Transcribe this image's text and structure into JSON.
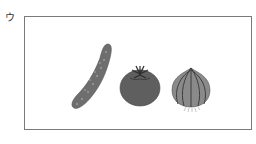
{
  "figure": {
    "label": "ウ",
    "items": [
      {
        "name": "cucumber",
        "description": "long curved dotted vegetable"
      },
      {
        "name": "tomato",
        "description": "round vegetable with leafy stem"
      },
      {
        "name": "onion",
        "description": "striped bulb with roots"
      }
    ],
    "colors": {
      "frame": "#7a7a7a",
      "cucumber": "#6e6e6e",
      "tomato": "#5f5f5f",
      "onion": "#8a8a8a"
    }
  }
}
